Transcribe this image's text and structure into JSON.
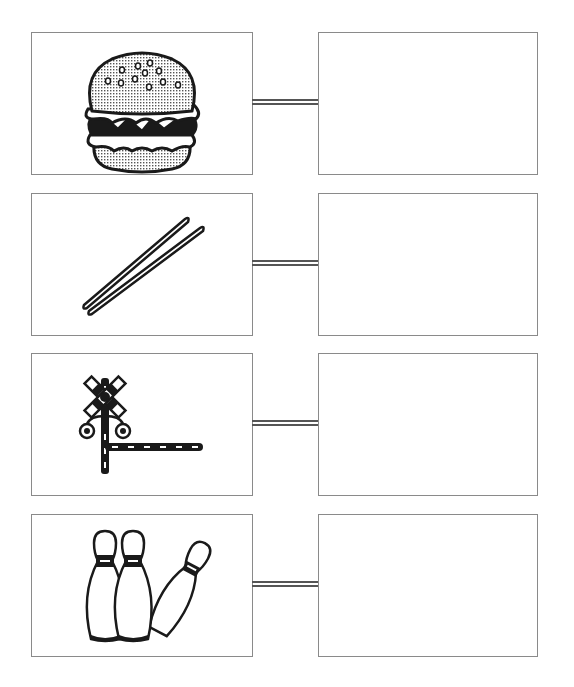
{
  "worksheet": {
    "rows": [
      {
        "picture": "hamburger",
        "picture_icon": "hamburger-icon",
        "answer": ""
      },
      {
        "picture": "chopsticks",
        "picture_icon": "chopsticks-icon",
        "answer": ""
      },
      {
        "picture": "railroad crossing",
        "picture_icon": "railroad-crossing-icon",
        "answer": ""
      },
      {
        "picture": "bowling pins",
        "picture_icon": "bowling-pins-icon",
        "answer": ""
      }
    ]
  },
  "colors": {
    "border": "#8a8a8a",
    "ink": "#1a1a1a",
    "connector": "#555555",
    "background": "#ffffff"
  }
}
